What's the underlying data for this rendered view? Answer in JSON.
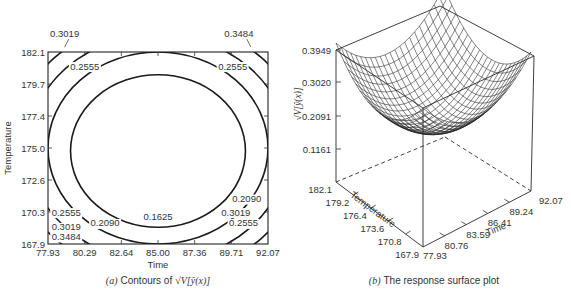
{
  "chart_data": [
    {
      "type": "contour",
      "panel": "(a)",
      "caption_prefix": "(a)",
      "caption_text": "Contours of",
      "caption_math": "√V[ŷ(x)]",
      "xlabel": "Time",
      "ylabel": "Temperature",
      "x_ticks": [
        "77.93",
        "80.29",
        "82.64",
        "85.00",
        "87.36",
        "89.71",
        "92.07"
      ],
      "y_ticks": [
        "167.9",
        "170.3",
        "172.6",
        "175.0",
        "177.4",
        "179.7",
        "182.1"
      ],
      "xlim": [
        77.93,
        92.07
      ],
      "ylim": [
        167.9,
        182.1
      ],
      "contour_levels": [
        0.1625,
        0.209,
        0.2555,
        0.3019,
        0.3484
      ],
      "labels": [
        {
          "text": "0.3019",
          "x": 79.0,
          "y": 183.2,
          "leader": true
        },
        {
          "text": "0.2555",
          "x": 80.3,
          "y": 180.8
        },
        {
          "text": "0.3484",
          "x": 90.2,
          "y": 183.2,
          "leader": true
        },
        {
          "text": "0.2555",
          "x": 89.8,
          "y": 180.8
        },
        {
          "text": "0.1625",
          "x": 85.0,
          "y": 169.7
        },
        {
          "text": "0.2090",
          "x": 81.6,
          "y": 169.2
        },
        {
          "text": "0.2555",
          "x": 79.1,
          "y": 170.0
        },
        {
          "text": "0.3019",
          "x": 79.1,
          "y": 168.9
        },
        {
          "text": "0.3484",
          "x": 79.1,
          "y": 168.2
        },
        {
          "text": "0.2090",
          "x": 90.7,
          "y": 171.0
        },
        {
          "text": "0.3019",
          "x": 90.0,
          "y": 170.0
        },
        {
          "text": "0.2555",
          "x": 90.5,
          "y": 169.2
        }
      ],
      "grid": false
    },
    {
      "type": "surface",
      "panel": "(b)",
      "caption_prefix": "(b)",
      "caption_text": "The response surface plot",
      "xlabel": "Time",
      "ylabel": "Temperature",
      "zlabel": "√V[ŷ(x)]",
      "x_ticks": [
        "77.93",
        "80.76",
        "83.59",
        "86.41",
        "89.24",
        "92.07"
      ],
      "y_ticks": [
        "167.9",
        "170.8",
        "173.6",
        "176.4",
        "179.2",
        "182.1"
      ],
      "z_ticks": [
        "0.1161",
        "0.2091",
        "0.3020",
        "0.3949"
      ],
      "zlim": [
        0.1161,
        0.3949
      ],
      "shape": "bowl (paraboloid), minimum at center (85.00, 175.0), maximum at corners 0.3949",
      "grid": false
    }
  ]
}
